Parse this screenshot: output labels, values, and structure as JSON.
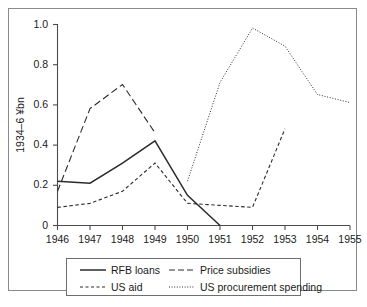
{
  "chart_data": {
    "type": "line",
    "title": "",
    "subtitle": "",
    "xlabel": "",
    "ylabel": "1934–6 ¥bn",
    "x": [
      1946,
      1947,
      1948,
      1949,
      1950,
      1951,
      1952,
      1953,
      1954,
      1955
    ],
    "xticklabels": [
      "1946",
      "1947",
      "1948",
      "1949",
      "1950",
      "1951",
      "1952",
      "1953",
      "1954",
      "1955"
    ],
    "yticklabels": [
      "0",
      "0.2",
      "0.4",
      "0.6",
      "0.8",
      "1.0"
    ],
    "ytickvalues": [
      0,
      0.2,
      0.4,
      0.6,
      0.8,
      1.0
    ],
    "xlim": [
      1946,
      1955
    ],
    "ylim": [
      0,
      1.0
    ],
    "grid": false,
    "legend_position": "bottom",
    "series": [
      {
        "name": "RFB loans",
        "style": "solid",
        "color": "#2b2b2b",
        "x": [
          1946,
          1947,
          1948,
          1949,
          1950,
          1951
        ],
        "values": [
          0.22,
          0.21,
          0.31,
          0.42,
          0.15,
          0.0
        ]
      },
      {
        "name": "Price subsidies",
        "style": "long-dash",
        "color": "#2b2b2b",
        "x": [
          1946,
          1947,
          1948,
          1949
        ],
        "values": [
          0.17,
          0.58,
          0.7,
          0.46
        ]
      },
      {
        "name": "US aid",
        "style": "short-dash",
        "color": "#2b2b2b",
        "x": [
          1946,
          1947,
          1948,
          1949,
          1950,
          1951,
          1952,
          1953
        ],
        "values": [
          0.09,
          0.11,
          0.17,
          0.31,
          0.11,
          0.1,
          0.09,
          0.48
        ]
      },
      {
        "name": "US procurement spending",
        "style": "dotted",
        "color": "#2b2b2b",
        "x": [
          1950,
          1951,
          1952,
          1953,
          1954,
          1955
        ],
        "values": [
          0.22,
          0.71,
          0.98,
          0.89,
          0.65,
          0.61
        ]
      }
    ]
  },
  "axes": {
    "y_title": "1934–6 ¥bn",
    "y_ticks": [
      "1.0",
      "0.8",
      "0.6",
      "0.4",
      "0.2",
      "0"
    ],
    "x_ticks": [
      "1946",
      "1947",
      "1948",
      "1949",
      "1950",
      "1951",
      "1952",
      "1953",
      "1954",
      "1955"
    ]
  },
  "legend": {
    "entries": [
      {
        "label": "RFB loans",
        "style": "solid"
      },
      {
        "label": "Price subsidies",
        "style": "long-dash"
      },
      {
        "label": "US aid",
        "style": "short-dash"
      },
      {
        "label": "US procurement spending",
        "style": "dotted"
      }
    ]
  }
}
